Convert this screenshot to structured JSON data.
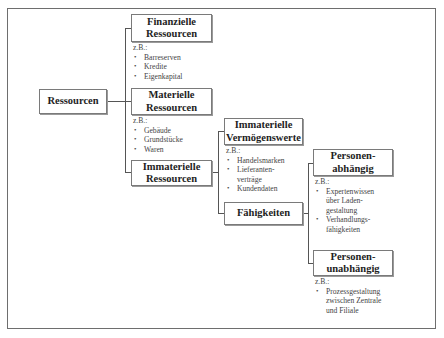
{
  "diagram": {
    "root": {
      "label": "Ressourcen"
    },
    "level1": [
      {
        "label": "Finanzielle\nRessourcen",
        "examples_prefix": "z.B.:",
        "examples": [
          "Barreserven",
          "Kredite",
          "Eigenkapital"
        ]
      },
      {
        "label": "Materielle\nRessourcen",
        "examples_prefix": "z.B.:",
        "examples": [
          "Gebäude",
          "Grundstücke",
          "Waren"
        ]
      },
      {
        "label": "Immaterielle\nRessourcen"
      }
    ],
    "level2": [
      {
        "label": "Immaterielle\nVermögenswerte",
        "examples_prefix": "z.B.:",
        "examples": [
          "Handelsmarken",
          "Lieferanten-\nverträge",
          "Kundendaten"
        ]
      },
      {
        "label": "Fähigkeiten"
      }
    ],
    "level3": [
      {
        "label": "Personen-\nabhängig",
        "examples_prefix": "z.B.:",
        "examples": [
          "Expertenwissen\nüber Laden-\ngestaltung",
          "Verhandlungs-\nfähigkeiten"
        ]
      },
      {
        "label": "Personen-\nunabhängig",
        "examples_prefix": "z.B.:",
        "examples": [
          "Prozessgestaltung\nzwischen Zentrale\nund Filiale"
        ]
      }
    ]
  }
}
